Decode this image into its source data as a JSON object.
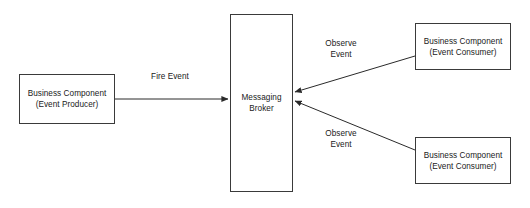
{
  "diagram": {
    "stroke_color": "#3a3a3a",
    "text_color": "#1a1a1a",
    "background_color": "#ffffff",
    "nodes": [
      {
        "id": "producer",
        "line1": "Business Component",
        "line2": "(Event Producer)"
      },
      {
        "id": "broker",
        "line1": "Messaging",
        "line2": "Broker"
      },
      {
        "id": "consumer_top",
        "line1": "Business Component",
        "line2": "(Event Consumer)"
      },
      {
        "id": "consumer_bottom",
        "line1": "Business Component",
        "line2": "(Event Consumer)"
      }
    ],
    "edges": [
      {
        "id": "fire_event",
        "line1": "Fire Event",
        "line2": "",
        "from": "producer",
        "to": "broker"
      },
      {
        "id": "observe_event_top",
        "line1": "Observe",
        "line2": "Event",
        "from": "consumer_top",
        "to": "broker"
      },
      {
        "id": "observe_event_bottom",
        "line1": "Observe",
        "line2": "Event",
        "from": "consumer_bottom",
        "to": "broker"
      }
    ]
  }
}
